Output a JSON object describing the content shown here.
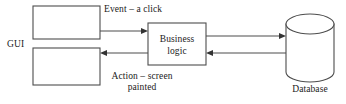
{
  "diagram": {
    "background_color": "#ffffff",
    "stroke_color": "#4d4d4d",
    "text_color": "#1a1a1a",
    "nodes": {
      "gui_label": "GUI",
      "gui_top_box": "",
      "gui_bottom_box": "",
      "business_logic_line1": "Business",
      "business_logic_line2": "logic",
      "database_label": "Database"
    },
    "edges": {
      "event_label": "Event – a click",
      "action_label_line1": "Action – screen",
      "action_label_line2": "painted",
      "business_to_database": "",
      "database_to_business": ""
    }
  }
}
